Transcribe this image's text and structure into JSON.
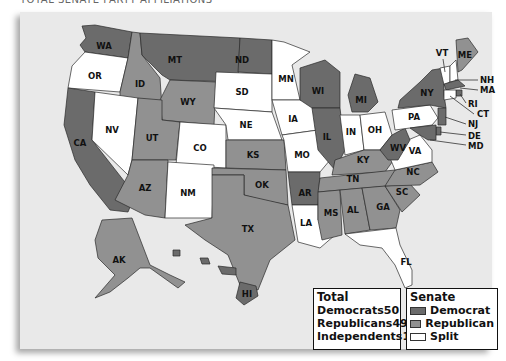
{
  "header": {
    "partial_title": "TOTAL SENATE PARTY AFFILIATIONS"
  },
  "colors": {
    "democrat": "#6b6b6b",
    "republican": "#919191",
    "split": "#ffffff",
    "background": "#e9e9e9"
  },
  "states": [
    {
      "abbr": "WA",
      "party": "democrat"
    },
    {
      "abbr": "OR",
      "party": "split"
    },
    {
      "abbr": "CA",
      "party": "democrat"
    },
    {
      "abbr": "ID",
      "party": "republican"
    },
    {
      "abbr": "NV",
      "party": "split"
    },
    {
      "abbr": "MT",
      "party": "democrat"
    },
    {
      "abbr": "WY",
      "party": "republican"
    },
    {
      "abbr": "UT",
      "party": "republican"
    },
    {
      "abbr": "AZ",
      "party": "republican"
    },
    {
      "abbr": "CO",
      "party": "split"
    },
    {
      "abbr": "NM",
      "party": "split"
    },
    {
      "abbr": "ND",
      "party": "democrat"
    },
    {
      "abbr": "SD",
      "party": "split"
    },
    {
      "abbr": "NE",
      "party": "split"
    },
    {
      "abbr": "KS",
      "party": "republican"
    },
    {
      "abbr": "OK",
      "party": "republican"
    },
    {
      "abbr": "TX",
      "party": "republican"
    },
    {
      "abbr": "MN",
      "party": "split"
    },
    {
      "abbr": "IA",
      "party": "split"
    },
    {
      "abbr": "MO",
      "party": "split"
    },
    {
      "abbr": "AR",
      "party": "democrat"
    },
    {
      "abbr": "LA",
      "party": "split"
    },
    {
      "abbr": "WI",
      "party": "democrat"
    },
    {
      "abbr": "IL",
      "party": "democrat"
    },
    {
      "abbr": "MI",
      "party": "democrat"
    },
    {
      "abbr": "IN",
      "party": "split"
    },
    {
      "abbr": "OH",
      "party": "split"
    },
    {
      "abbr": "KY",
      "party": "republican"
    },
    {
      "abbr": "TN",
      "party": "republican"
    },
    {
      "abbr": "MS",
      "party": "republican"
    },
    {
      "abbr": "AL",
      "party": "republican"
    },
    {
      "abbr": "GA",
      "party": "republican"
    },
    {
      "abbr": "FL",
      "party": "split"
    },
    {
      "abbr": "SC",
      "party": "republican"
    },
    {
      "abbr": "NC",
      "party": "republican"
    },
    {
      "abbr": "VA",
      "party": "split"
    },
    {
      "abbr": "WV",
      "party": "democrat"
    },
    {
      "abbr": "PA",
      "party": "split"
    },
    {
      "abbr": "NY",
      "party": "democrat"
    },
    {
      "abbr": "VT",
      "party": "split"
    },
    {
      "abbr": "NH",
      "party": "split"
    },
    {
      "abbr": "ME",
      "party": "republican"
    },
    {
      "abbr": "MA",
      "party": "democrat"
    },
    {
      "abbr": "RI",
      "party": "democrat"
    },
    {
      "abbr": "CT",
      "party": "split"
    },
    {
      "abbr": "NJ",
      "party": "democrat"
    },
    {
      "abbr": "DE",
      "party": "democrat"
    },
    {
      "abbr": "MD",
      "party": "democrat"
    },
    {
      "abbr": "AK",
      "party": "republican"
    },
    {
      "abbr": "HI",
      "party": "democrat"
    }
  ],
  "legend_total": {
    "title": "Total",
    "rows": [
      {
        "label": "Democrats",
        "value": "50"
      },
      {
        "label": "Republicans",
        "value": "49"
      },
      {
        "label": "Independents",
        "value": "1"
      }
    ]
  },
  "legend_senate": {
    "title": "Senate",
    "items": [
      {
        "label": "Democrat",
        "color": "#6b6b6b"
      },
      {
        "label": "Republican",
        "color": "#919191"
      },
      {
        "label": "Split",
        "color": "#ffffff"
      }
    ]
  }
}
